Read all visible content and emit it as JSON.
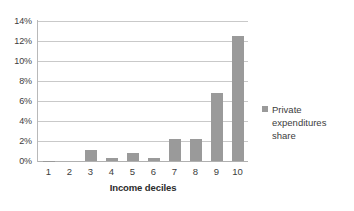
{
  "chart_data": {
    "type": "bar",
    "title": "",
    "subtitle": "",
    "xlabel": "Income deciles",
    "ylabel": "",
    "categories": [
      "1",
      "2",
      "3",
      "4",
      "5",
      "6",
      "7",
      "8",
      "9",
      "10"
    ],
    "values": [
      0.05,
      0.0,
      1.1,
      0.3,
      0.8,
      0.3,
      2.2,
      2.25,
      6.8,
      12.5
    ],
    "series": [
      {
        "name": "Private expenditures share",
        "values": [
          0.05,
          0.0,
          1.1,
          0.3,
          0.8,
          0.3,
          2.2,
          2.25,
          6.8,
          12.5
        ],
        "color": "#9a9a9a"
      }
    ],
    "ylim": [
      0,
      14
    ],
    "ytick_values": [
      0,
      2,
      4,
      6,
      8,
      10,
      12,
      14
    ],
    "ytick_labels": [
      "0%",
      "2%",
      "4%",
      "6%",
      "8%",
      "10%",
      "12%",
      "14%"
    ],
    "grid": true,
    "grid_axis": "y",
    "legend_position": "right",
    "value_unit": "%"
  },
  "legend": {
    "entries": [
      {
        "label": "Private expenditures share",
        "color": "#9a9a9a"
      }
    ]
  },
  "colors": {
    "bar": "#9a9a9a",
    "gridline": "#c9c9c9",
    "axis": "#b9b9b9",
    "text": "#3d3d3d",
    "background": "#ffffff"
  }
}
